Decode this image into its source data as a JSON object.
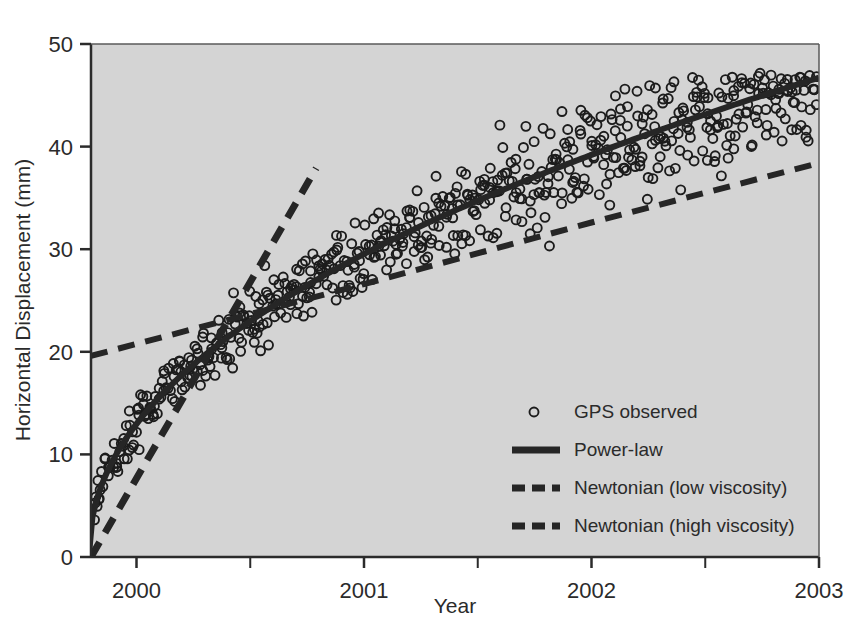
{
  "chart_data": {
    "type": "scatter",
    "title": "",
    "xlabel": "Year",
    "ylabel": "Horizontal Displacement (mm)",
    "xlim": [
      1999.8,
      2003.0
    ],
    "ylim": [
      0,
      50
    ],
    "grid": false,
    "legend_position": "inside-lower-right",
    "x_ticks": [
      2000,
      2001,
      2002,
      2003
    ],
    "x_tick_labels": [
      "2000",
      "2001",
      "2002",
      "2003"
    ],
    "x_minor_ticks": [
      2000.5,
      2001.5,
      2002.5
    ],
    "y_ticks": [
      0,
      10,
      20,
      30,
      40,
      50
    ],
    "y_tick_labels": [
      "0",
      "10",
      "20",
      "30",
      "40",
      "50"
    ],
    "plot_background": "#d4d4d4",
    "series": [
      {
        "name": "GPS observed",
        "type": "scatter",
        "marker": "open-circle",
        "marker_size": 9,
        "color": "#1c1c1c",
        "n_points": 620,
        "model": "power-law-with-noise",
        "model_params": {
          "amplitude": 27.0,
          "exponent": 0.47,
          "t0": 1999.79
        },
        "noise_sigma_start": 1.1,
        "noise_sigma_end": 3.3,
        "x_range": [
          1999.81,
          2002.99
        ],
        "y_range": [
          0.2,
          47.2
        ]
      },
      {
        "name": "Power-law",
        "type": "line",
        "style": "solid",
        "width": 6,
        "color": "#262626",
        "model_params": {
          "amplitude": 27.0,
          "exponent": 0.47,
          "t0": 1999.79
        },
        "x_range": [
          1999.79,
          2003.0
        ],
        "y_at_x": [
          {
            "x": 1999.79,
            "y": 0.0
          },
          {
            "x": 2000.0,
            "y": 13.5
          },
          {
            "x": 2000.25,
            "y": 17.4
          },
          {
            "x": 2000.5,
            "y": 20.4
          },
          {
            "x": 2001.0,
            "y": 25.2
          },
          {
            "x": 2001.5,
            "y": 29.1
          },
          {
            "x": 2002.0,
            "y": 32.4
          },
          {
            "x": 2002.5,
            "y": 35.3
          },
          {
            "x": 2003.0,
            "y": 37.9
          }
        ]
      },
      {
        "name": "Newtonian (low viscosity)",
        "type": "line",
        "style": "dashed",
        "width": 6,
        "color": "#262626",
        "x_range": [
          1999.8,
          2003.0
        ],
        "y_at_x": [
          {
            "x": 1999.8,
            "y": 19.6
          },
          {
            "x": 2001.0,
            "y": 26.6
          },
          {
            "x": 2002.0,
            "y": 32.6
          },
          {
            "x": 2003.0,
            "y": 38.4
          }
        ]
      },
      {
        "name": "Newtonian (high viscosity)",
        "type": "line",
        "style": "dashed",
        "width": 7,
        "color": "#262626",
        "x_range": [
          1999.8,
          2000.79
        ],
        "y_at_x": [
          {
            "x": 1999.8,
            "y": 0.0
          },
          {
            "x": 2000.79,
            "y": 37.9
          }
        ]
      }
    ],
    "legend_entries": [
      {
        "label": "GPS observed",
        "marker": "open-circle"
      },
      {
        "label": "Power-law",
        "marker": "solid-line"
      },
      {
        "label": "Newtonian (low viscosity)",
        "marker": "dashed-line"
      },
      {
        "label": "Newtonian (high viscosity)",
        "marker": "dashed-line"
      }
    ]
  }
}
